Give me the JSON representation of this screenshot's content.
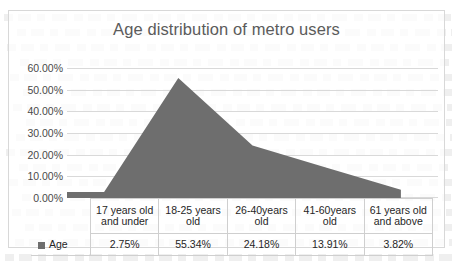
{
  "chart_data": {
    "type": "area",
    "title": "Age distribution of metro users",
    "xlabel": "",
    "ylabel": "",
    "categories": [
      "17 years old and under",
      "18-25 years old",
      "26-40years old",
      "41-60years old",
      "61 years old and above"
    ],
    "series": [
      {
        "name": "Age",
        "values": [
          2.75,
          55.34,
          24.18,
          13.91,
          3.82
        ],
        "value_labels": [
          "2.75%",
          "55.34%",
          "24.18%",
          "13.91%",
          "3.82%"
        ],
        "color": "#6e6e6e"
      }
    ],
    "ylim": [
      0,
      60
    ],
    "ytick_values": [
      0,
      10,
      20,
      30,
      40,
      50,
      60
    ],
    "ytick_labels": [
      "0.00%",
      "10.00%",
      "20.00%",
      "30.00%",
      "40.00%",
      "50.00%",
      "60.00%"
    ],
    "grid": true,
    "legend_position": "data-table-left",
    "has_data_table": true
  },
  "chart": {
    "title": "Age distribution of metro users",
    "title_color": "#5b5b5b",
    "frame_border_color": "#d8d8d8",
    "gridline_color": "#d9d9d9",
    "area_color": "#6e6e6e"
  },
  "data_table": {
    "legend_label": "Age",
    "category_headers": [
      {
        "line1": "17 years old",
        "line2": "and under"
      },
      {
        "line1": "18-25 years",
        "line2": "old"
      },
      {
        "line1": "26-40years",
        "line2": "old"
      },
      {
        "line1": "41-60years",
        "line2": "old"
      },
      {
        "line1": "61 years old",
        "line2": "and above"
      }
    ],
    "values": [
      "2.75%",
      "55.34%",
      "24.18%",
      "13.91%",
      "3.82%"
    ]
  }
}
